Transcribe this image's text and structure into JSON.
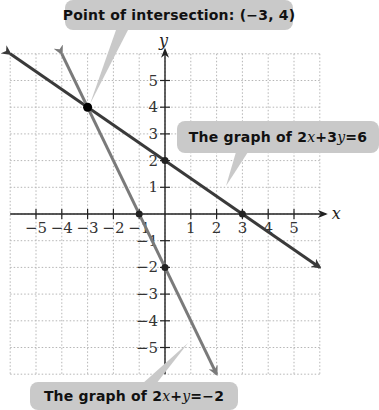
{
  "chart_data": {
    "type": "line",
    "title": "",
    "xlabel": "x",
    "ylabel": "y",
    "xlim": [
      -6,
      6
    ],
    "ylim": [
      -6,
      6
    ],
    "grid": true,
    "x_ticks": [
      -5,
      -4,
      -3,
      -2,
      -1,
      1,
      2,
      3,
      4,
      5
    ],
    "y_ticks": [
      5,
      4,
      3,
      2,
      1,
      -1,
      -2,
      -3,
      -4,
      -5
    ],
    "series": [
      {
        "name": "2x + 3y = 6",
        "equation": "y = 2 - (2/3)x",
        "points": [
          [
            -6,
            6
          ],
          [
            0,
            2
          ],
          [
            3,
            0
          ],
          [
            6,
            -2
          ]
        ],
        "color": "#3a3a3a",
        "marked_points": [
          [
            0,
            2
          ],
          [
            3,
            0
          ]
        ]
      },
      {
        "name": "2x + y = -2",
        "equation": "y = -2 - 2x",
        "points": [
          [
            -4,
            6
          ],
          [
            -1,
            0
          ],
          [
            0,
            -2
          ],
          [
            2,
            -6
          ]
        ],
        "color": "#7a7a7a",
        "marked_points": [
          [
            -1,
            0
          ],
          [
            0,
            -2
          ]
        ]
      }
    ],
    "annotations": [
      {
        "text": "Point of intersection: (-3, 4)",
        "point": [
          -3,
          4
        ]
      },
      {
        "text": "The graph of 2x + 3y = 6",
        "target_series": 0
      },
      {
        "text": "The graph of 2x + y = -2",
        "target_series": 1
      }
    ]
  },
  "labels": {
    "intersection": {
      "prefix": "Point of intersection: (",
      "value": "−3, 4",
      "suffix": ")"
    },
    "line1": {
      "prefix": "The graph of ",
      "eq_a": "2",
      "var_x": "x",
      "plus": " + ",
      "eq_b": "3",
      "var_y": "y",
      "equals": " = ",
      "rhs": "6"
    },
    "line2": {
      "prefix": "The graph of ",
      "eq_a": "2",
      "var_x": "x",
      "plus": " + ",
      "var_y": "y",
      "equals": " = ",
      "rhs": "−2"
    }
  },
  "axes": {
    "x_label": "x",
    "y_label": "y",
    "x_tick_labels": [
      "−5",
      "−4",
      "−3",
      "−2",
      "−1",
      "1",
      "2",
      "3",
      "4",
      "5"
    ],
    "y_tick_labels": [
      "5",
      "4",
      "3",
      "2",
      "1",
      "−1",
      "−2",
      "−3",
      "−4",
      "−5"
    ]
  },
  "colors": {
    "line1": "#3a3a3a",
    "line2": "#7a7a7a",
    "label_bg": "#c9c9c9",
    "grid": "#b5b5b5",
    "axis": "#222222"
  }
}
